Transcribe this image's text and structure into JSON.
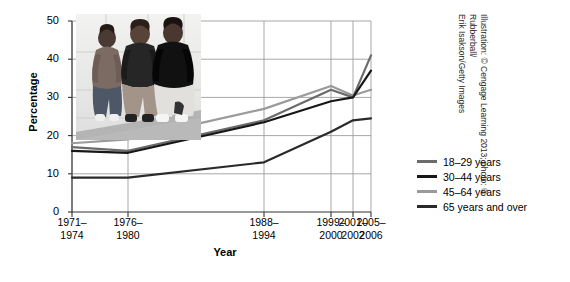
{
  "chart_data": {
    "type": "line",
    "title": "",
    "xlabel": "Year",
    "ylabel": "Percentage",
    "ylim": [
      0,
      50
    ],
    "yticks": [
      0,
      10,
      20,
      30,
      40,
      50
    ],
    "grid": true,
    "legend_position": "right",
    "categories": [
      "1971–1974",
      "1976–1980",
      "1988–1994",
      "1999–2000",
      "2001–2002",
      "2005–2006"
    ],
    "category_lines": [
      [
        "1971–",
        "1974"
      ],
      [
        "1976–",
        "1980"
      ],
      [
        "1988–",
        "1994"
      ],
      [
        "1999–",
        "2000"
      ],
      [
        "2001–",
        "2002"
      ],
      [
        "2005–",
        "2006"
      ]
    ],
    "series": [
      {
        "name": "18–29 years",
        "color": "#6b6b6b",
        "values": [
          17,
          16,
          24,
          32,
          30,
          41
        ]
      },
      {
        "name": "30–44 years",
        "color": "#171717",
        "values": [
          16,
          15.5,
          23.5,
          29,
          30,
          37
        ]
      },
      {
        "name": "45–64 years",
        "color": "#9a9a9a",
        "values": [
          18,
          19,
          27,
          33,
          30.5,
          32
        ]
      },
      {
        "name": "65 years and over",
        "color": "#2a2a2a",
        "values": [
          9,
          9,
          13,
          21,
          24,
          24.5
        ]
      }
    ]
  },
  "legend": {
    "items": [
      {
        "label": "18–29 years",
        "color": "#6b6b6b"
      },
      {
        "label": "30–44 years",
        "color": "#171717"
      },
      {
        "label": "45–64 years",
        "color": "#9a9a9a"
      },
      {
        "label": "65 years and over",
        "color": "#2a2a2a"
      }
    ]
  },
  "credit": {
    "line1": "Illustration: © Cengage Learning 2013; photo: © Rubberball/",
    "line2": "Erik Isakson/Getty Images"
  },
  "photo": {
    "alt": "three-people-standing-photo"
  }
}
